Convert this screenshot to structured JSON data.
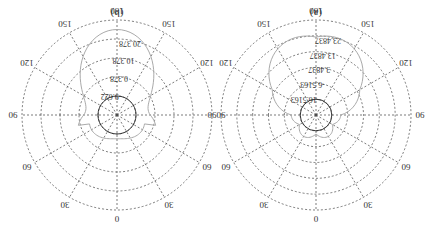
{
  "orientation": "rotated 180 degrees",
  "chart_data": [
    {
      "type": "polar",
      "title": "(a)",
      "angle_ticks": [
        "0",
        "30",
        "60",
        "90",
        "120",
        "150",
        "180",
        "150",
        "120",
        "90",
        "60",
        "30"
      ],
      "radial_tick_labels": [
        "-16.5163",
        "-6.5163",
        "3.4837",
        "13.4837",
        "23.4837"
      ],
      "radial_range": [
        -26.5163,
        23.4837
      ],
      "grid": true,
      "series": [
        {
          "name": "pattern",
          "color": "#aaaaaa",
          "shape": "main lobe toward 180, small back lobe toward 0"
        }
      ]
    },
    {
      "type": "polar",
      "title": "(b)",
      "angle_ticks": [
        "0",
        "30",
        "60",
        "90",
        "120",
        "150",
        "180",
        "150",
        "120",
        "90",
        "60",
        "30"
      ],
      "radial_tick_labels": [
        "-9.622",
        "0.378",
        "10.378",
        "20.378"
      ],
      "radial_range": [
        -19.622,
        20.378
      ],
      "grid": true,
      "series": [
        {
          "name": "pattern",
          "color": "#aaaaaa",
          "shape": "multi-lobe pattern, main lobe toward 180 with side lobes near 120/240"
        }
      ]
    }
  ],
  "panels": {
    "a": {
      "label": "(a)"
    },
    "b": {
      "label": "(b)"
    }
  }
}
